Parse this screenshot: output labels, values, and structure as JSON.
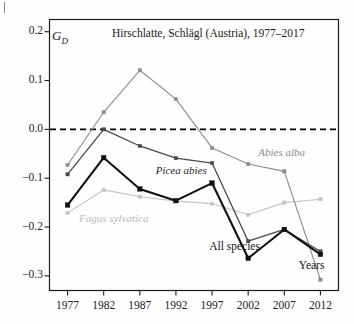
{
  "figure": {
    "title": "Hirschlatte, Schlägl (Austria), 1977–2017",
    "y_axis_symbol": "G",
    "y_axis_subscript": "D",
    "x_axis_label": "Years",
    "all_species_label": "All species"
  },
  "chart_data": {
    "type": "line",
    "title": "Hirschlatte, Schlägl (Austria), 1977–2017",
    "xlabel": "Years",
    "ylabel": "G_D",
    "x": [
      1977,
      1982,
      1987,
      1992,
      1997,
      2002,
      2007,
      2012
    ],
    "xtick_labels": [
      "1977",
      "1982",
      "1987",
      "1992",
      "1997",
      "2002",
      "2007",
      "2012"
    ],
    "ytick_labels": [
      "0.2",
      "0.1",
      "0.0",
      "-0.1",
      "-0.2",
      "-0.3"
    ],
    "ytick_values": [
      0.2,
      0.1,
      0.0,
      -0.1,
      -0.2,
      -0.3
    ],
    "ylim": [
      -0.33,
      0.225
    ],
    "xlim": [
      1974.5,
      2014.5
    ],
    "grid": false,
    "legend": "inline-annotations",
    "reference_line": {
      "y": 0.0,
      "style": "dashed",
      "color": "#000000"
    },
    "series": [
      {
        "name": "All species",
        "color": "#111111",
        "width": 2.1,
        "marker": "square",
        "values": [
          -0.155,
          -0.058,
          -0.122,
          -0.146,
          -0.11,
          -0.264,
          -0.205,
          -0.256
        ]
      },
      {
        "name": "Picea abies",
        "color": "#4a4a4a",
        "width": 1.3,
        "marker": "square",
        "values": [
          -0.092,
          0.0,
          -0.034,
          -0.059,
          -0.069,
          -0.229,
          -0.205,
          -0.25
        ]
      },
      {
        "name": "Abies alba",
        "color": "#8c8c8c",
        "width": 1.1,
        "marker": "square",
        "values": [
          -0.073,
          0.035,
          0.121,
          0.062,
          -0.038,
          -0.071,
          -0.086,
          -0.308
        ]
      },
      {
        "name": "Fagus sylvatica",
        "color": "#c4c4c4",
        "width": 1.1,
        "marker": "square",
        "values": [
          -0.171,
          -0.124,
          -0.138,
          -0.147,
          -0.152,
          -0.175,
          -0.15,
          -0.143
        ]
      }
    ],
    "annotations": [
      {
        "text": "Abies alba",
        "x": 2003.4,
        "y": -0.05,
        "color": "#8c8c8c",
        "italic": true
      },
      {
        "text": "Picea abies",
        "x": 1989.2,
        "y": -0.088,
        "color": "#262626",
        "italic": true
      },
      {
        "text": "Fagus sylvatica",
        "x": 1978.6,
        "y": -0.185,
        "color": "#b9b9b9",
        "italic": true
      },
      {
        "text": "All species",
        "x": 1996.6,
        "y": -0.243,
        "color": "#111111",
        "italic": false
      },
      {
        "text": "Years",
        "x": 2009.0,
        "y": -0.282,
        "color": "#111111",
        "italic": false
      }
    ]
  }
}
